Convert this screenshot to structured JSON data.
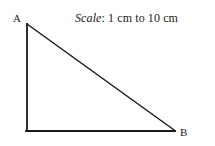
{
  "figure": {
    "background_color": "#ffffff",
    "line_color": "#1a1a1a",
    "width": 215,
    "height": 146
  },
  "annotation": {
    "scale_word": "Scale",
    "scale_rest": ": 1 cm to 10 cm",
    "full_text": "Scale: 1 cm to 10 cm",
    "from_length": "1 cm",
    "to_length": "10 cm"
  },
  "labels": {
    "vertex_a": "A",
    "vertex_b": "B"
  },
  "shape": {
    "type": "right-triangle",
    "vertices": [
      {
        "name": "A",
        "x": 27,
        "y": 24
      },
      {
        "name": "C",
        "x": 27,
        "y": 131
      },
      {
        "name": "B",
        "x": 175,
        "y": 131
      }
    ],
    "edges": [
      {
        "name": "vertical-leg",
        "from": "A",
        "to": "C"
      },
      {
        "name": "horizontal-leg",
        "from": "C",
        "to": "B"
      },
      {
        "name": "hypotenuse",
        "from": "A",
        "to": "B"
      }
    ],
    "right_angle_at": "C"
  }
}
